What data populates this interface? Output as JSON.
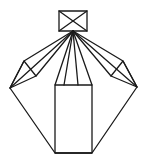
{
  "figure": {
    "canvas": {
      "width": 148,
      "height": 164,
      "background_color": "#ffffff"
    },
    "style": {
      "stroke_color": "#1a1a1a",
      "stroke_width": 1.3,
      "fill": "none"
    },
    "apex_point": {
      "x": 73,
      "y": 31
    },
    "parts": [
      {
        "name": "top-rectangle",
        "kind": "polygon",
        "closed": true,
        "points": "59,11 87,11 87,31 59,31"
      },
      {
        "name": "top-rectangle-diagonal-left",
        "kind": "polyline",
        "closed": false,
        "points": "59,11 87,31"
      },
      {
        "name": "top-rectangle-diagonal-right",
        "kind": "polyline",
        "closed": false,
        "points": "87,11 59,31"
      },
      {
        "name": "outer-polygon",
        "kind": "polygon",
        "closed": true,
        "points": "73,31 24,61 10,88 55,153 92,153 137,87 123,61"
      },
      {
        "name": "left-wing-fold-triangle",
        "kind": "polygon",
        "closed": true,
        "points": "24,61 10,88 36,76"
      },
      {
        "name": "right-wing-fold-triangle",
        "kind": "polygon",
        "closed": true,
        "points": "123,61 137,87 111,76"
      },
      {
        "name": "ray-apex-to-left-fold-inner",
        "kind": "polyline",
        "closed": false,
        "points": "73,31 36,76"
      },
      {
        "name": "ray-apex-to-left-tip",
        "kind": "polyline",
        "closed": false,
        "points": "73,31 10,88"
      },
      {
        "name": "ray-apex-to-right-fold-inner",
        "kind": "polyline",
        "closed": false,
        "points": "73,31 111,76"
      },
      {
        "name": "ray-apex-to-right-tip",
        "kind": "polyline",
        "closed": false,
        "points": "73,31 137,87"
      },
      {
        "name": "ray-apex-to-body-top-left",
        "kind": "polyline",
        "closed": false,
        "points": "73,31 55,85"
      },
      {
        "name": "ray-apex-to-body-inner-left",
        "kind": "polyline",
        "closed": false,
        "points": "73,31 64,85"
      },
      {
        "name": "ray-apex-to-body-inner-right",
        "kind": "polyline",
        "closed": false,
        "points": "73,31 78,85"
      },
      {
        "name": "ray-apex-to-body-top-right",
        "kind": "polyline",
        "closed": false,
        "points": "73,31 92,85"
      },
      {
        "name": "central-rectangle",
        "kind": "polygon",
        "closed": true,
        "points": "55,85 92,85 92,153 55,153"
      }
    ]
  }
}
